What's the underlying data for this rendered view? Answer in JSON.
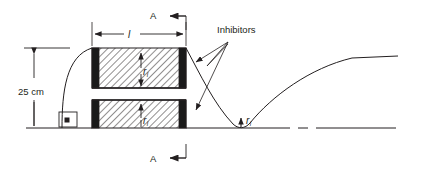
{
  "figure": {
    "title_text": "",
    "labels": {
      "height_dimension": "25 cm",
      "length_dimension": "l",
      "callout_inhibitors": "Inhibitors",
      "section_mark_top": "A",
      "section_mark_bottom": "A",
      "radius_inner_upper": "r",
      "radius_inner_upper_sub": "i",
      "radius_inner_lower": "r",
      "radius_inner_lower_sub": "i",
      "radius_throat": "r",
      "radius_throat_sub": "i"
    },
    "colors": {
      "line": "#231f20",
      "hatch": "#231f20",
      "inhibitor_fill": "#1a1a1a",
      "background": "#ffffff",
      "thin_rule": "#58595b"
    },
    "geometry": {
      "axis_y": 128,
      "grain_left_x": 92,
      "grain_right_x": 186,
      "upper_block_top": 48,
      "upper_block_bottom": 88,
      "lower_block_top": 100,
      "lower_block_bottom": 128
    },
    "elements": {
      "perpendicular_symbol": "square-dot",
      "baseline_style": "centerline-dash-dot",
      "hatch_pattern": "diagonal-45"
    }
  }
}
